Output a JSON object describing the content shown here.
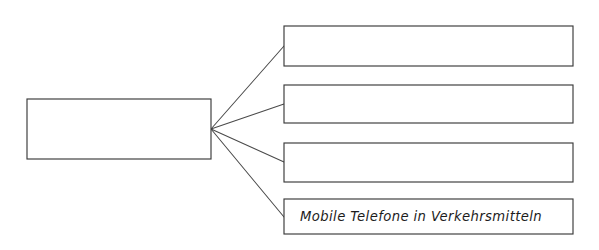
{
  "diagram": {
    "type": "mind-map-tree",
    "background_color": "#ffffff",
    "line_color": "#4a4a4a",
    "box_stroke_color": "#3a3a3a",
    "box_fill_color": "#ffffff",
    "text_color": "#1c1c1c",
    "style": "hand-drawn",
    "root": {
      "label": "",
      "x": 27,
      "y": 99,
      "width": 184,
      "height": 60
    },
    "branch_point": {
      "x": 211,
      "y": 129
    },
    "children": [
      {
        "label": "",
        "x": 284,
        "y": 26,
        "width": 289,
        "height": 40,
        "anchor_x": 284,
        "anchor_y": 46
      },
      {
        "label": "",
        "x": 284,
        "y": 85,
        "width": 289,
        "height": 38,
        "anchor_x": 284,
        "anchor_y": 104
      },
      {
        "label": "",
        "x": 284,
        "y": 143,
        "width": 289,
        "height": 39,
        "anchor_x": 284,
        "anchor_y": 162
      },
      {
        "label": "Mobile Telefone in Verkehrsmitteln",
        "x": 284,
        "y": 199,
        "width": 289,
        "height": 35,
        "anchor_x": 284,
        "anchor_y": 217,
        "text_x": 300,
        "text_y": 217
      }
    ]
  }
}
